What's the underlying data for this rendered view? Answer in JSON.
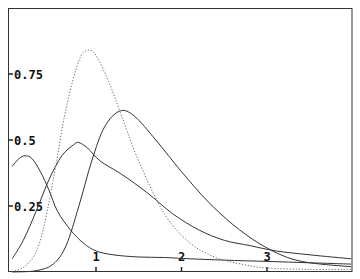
{
  "chart_data": {
    "type": "line",
    "title": "",
    "xlabel": "",
    "ylabel": "",
    "xlim": [
      0,
      4.0
    ],
    "ylim": [
      0,
      0.99
    ],
    "grid": false,
    "legend": null,
    "x_ticks": [
      {
        "value": 1,
        "label": "1"
      },
      {
        "value": 2,
        "label": "2"
      },
      {
        "value": 3,
        "label": "3"
      }
    ],
    "y_ticks": [
      {
        "value": 0.25,
        "label": "0.25"
      },
      {
        "value": 0.5,
        "label": "0.5"
      },
      {
        "value": 0.75,
        "label": "0.75"
      }
    ],
    "series": [
      {
        "name": "curve-a",
        "style": "solid",
        "x": [
          0.02,
          0.1,
          0.17,
          0.25,
          0.35,
          0.45,
          0.55,
          0.7,
          0.85,
          1.0,
          1.2,
          1.5,
          1.8,
          2.1,
          2.5,
          3.0,
          3.5,
          4.0
        ],
        "y": [
          0.4,
          0.43,
          0.44,
          0.43,
          0.38,
          0.31,
          0.23,
          0.16,
          0.11,
          0.08,
          0.065,
          0.057,
          0.055,
          0.05,
          0.045,
          0.04,
          0.035,
          0.03
        ]
      },
      {
        "name": "curve-b",
        "style": "solid",
        "x": [
          0.02,
          0.15,
          0.3,
          0.45,
          0.6,
          0.75,
          0.8,
          0.9,
          1.05,
          1.3,
          1.6,
          1.9,
          2.2,
          2.5,
          2.8,
          3.1,
          3.5,
          4.0
        ],
        "y": [
          0.05,
          0.12,
          0.23,
          0.35,
          0.44,
          0.485,
          0.49,
          0.47,
          0.42,
          0.37,
          0.3,
          0.22,
          0.16,
          0.12,
          0.1,
          0.08,
          0.065,
          0.05
        ]
      },
      {
        "name": "curve-c",
        "style": "solid",
        "x": [
          0.02,
          0.3,
          0.5,
          0.65,
          0.8,
          0.95,
          1.1,
          1.28,
          1.45,
          1.7,
          2.0,
          2.3,
          2.6,
          2.9,
          3.2,
          3.5,
          4.0
        ],
        "y": [
          0.0,
          0.005,
          0.03,
          0.1,
          0.25,
          0.42,
          0.55,
          0.61,
          0.59,
          0.5,
          0.38,
          0.27,
          0.18,
          0.11,
          0.06,
          0.035,
          0.02
        ]
      },
      {
        "name": "curve-d-dotted",
        "style": "dotted",
        "x": [
          0.02,
          0.2,
          0.35,
          0.5,
          0.65,
          0.8,
          0.9,
          1.0,
          1.15,
          1.3,
          1.5,
          1.8,
          2.1,
          2.4,
          2.7,
          3.0,
          3.5,
          4.0
        ],
        "y": [
          0.0,
          0.03,
          0.12,
          0.35,
          0.62,
          0.8,
          0.84,
          0.82,
          0.72,
          0.59,
          0.42,
          0.22,
          0.11,
          0.055,
          0.03,
          0.015,
          0.01,
          0.01
        ]
      }
    ]
  }
}
